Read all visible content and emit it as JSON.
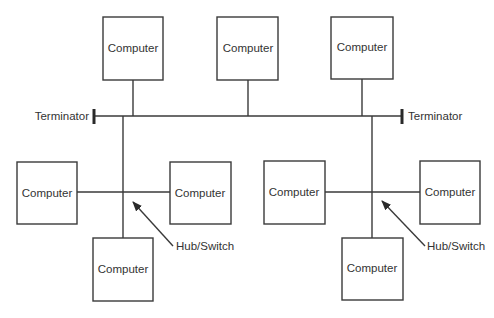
{
  "diagram": {
    "type": "network-topology",
    "bus": {
      "left_terminator_label": "Terminator",
      "right_terminator_label": "Terminator"
    },
    "top_computers": [
      {
        "label": "Computer"
      },
      {
        "label": "Computer"
      },
      {
        "label": "Computer"
      }
    ],
    "left_star": {
      "hub_label": "Hub/Switch",
      "computers": [
        {
          "label": "Computer"
        },
        {
          "label": "Computer"
        },
        {
          "label": "Computer"
        }
      ]
    },
    "right_star": {
      "hub_label": "Hub/Switch",
      "computers": [
        {
          "label": "Computer"
        },
        {
          "label": "Computer"
        },
        {
          "label": "Computer"
        }
      ]
    }
  }
}
